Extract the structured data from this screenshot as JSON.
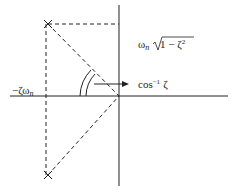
{
  "diagram": {
    "labels": {
      "real_part": "−ζω",
      "real_part_sub": "n",
      "imag_part_omega": "ω",
      "imag_part_sub": "n",
      "imag_part_sqrt": "1 − ζ",
      "imag_part_sup": "2",
      "angle_label": "cos",
      "angle_sup": "−1",
      "angle_zeta": "ζ"
    },
    "poles": [
      {
        "name": "upper-pole",
        "x": 48,
        "y": 24
      },
      {
        "name": "lower-pole",
        "x": 48,
        "y": 175
      }
    ],
    "axes": {
      "origin_x": 119,
      "origin_y": 96
    },
    "colors": {
      "line": "#222222",
      "background": "#ffffff"
    }
  }
}
